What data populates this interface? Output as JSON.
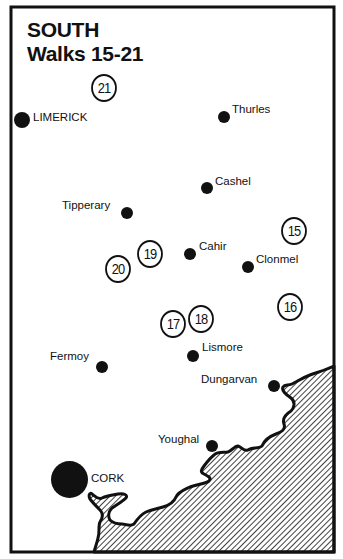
{
  "title": {
    "region": "SOUTH",
    "subtitle": "Walks 15-21"
  },
  "colors": {
    "ink": "#111111",
    "background": "#ffffff",
    "sea_hatch": "#111111"
  },
  "towns": [
    {
      "name": "LIMERICK",
      "x": 22,
      "y": 120
    },
    {
      "name": "Thurles",
      "x": 224,
      "y": 117
    },
    {
      "name": "Cashel",
      "x": 207,
      "y": 188
    },
    {
      "name": "Tipperary",
      "x": 127,
      "y": 213
    },
    {
      "name": "Cahir",
      "x": 190,
      "y": 254
    },
    {
      "name": "Clonmel",
      "x": 248,
      "y": 267
    },
    {
      "name": "Lismore",
      "x": 193,
      "y": 356
    },
    {
      "name": "Fermoy",
      "x": 102,
      "y": 367
    },
    {
      "name": "Dungarvan",
      "x": 274,
      "y": 386
    },
    {
      "name": "Youghal",
      "x": 212,
      "y": 446
    },
    {
      "name": "CORK",
      "x": 69,
      "y": 479
    }
  ],
  "walks": [
    {
      "number": "21",
      "x": 104,
      "y": 88
    },
    {
      "number": "15",
      "x": 294,
      "y": 231
    },
    {
      "number": "19",
      "x": 150,
      "y": 254
    },
    {
      "number": "20",
      "x": 119,
      "y": 268
    },
    {
      "number": "16",
      "x": 290,
      "y": 307
    },
    {
      "number": "17",
      "x": 174,
      "y": 323
    },
    {
      "number": "18",
      "x": 201,
      "y": 318
    }
  ],
  "labels": {
    "sea": "sea (hatched)"
  }
}
